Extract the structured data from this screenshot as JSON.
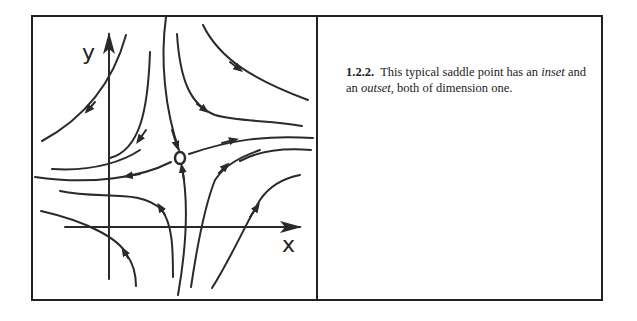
{
  "figure": {
    "number": "1.2.2.",
    "caption_parts": {
      "text1": "This typical saddle point has an",
      "italic1": "inset",
      "text2": " and an ",
      "italic2": "outset,",
      "text3": " both of dimension one."
    },
    "axes": {
      "x_label": "x",
      "y_label": "y"
    },
    "saddle_point_label": "saddle-point",
    "stroke_color": "#2a2a2a"
  }
}
